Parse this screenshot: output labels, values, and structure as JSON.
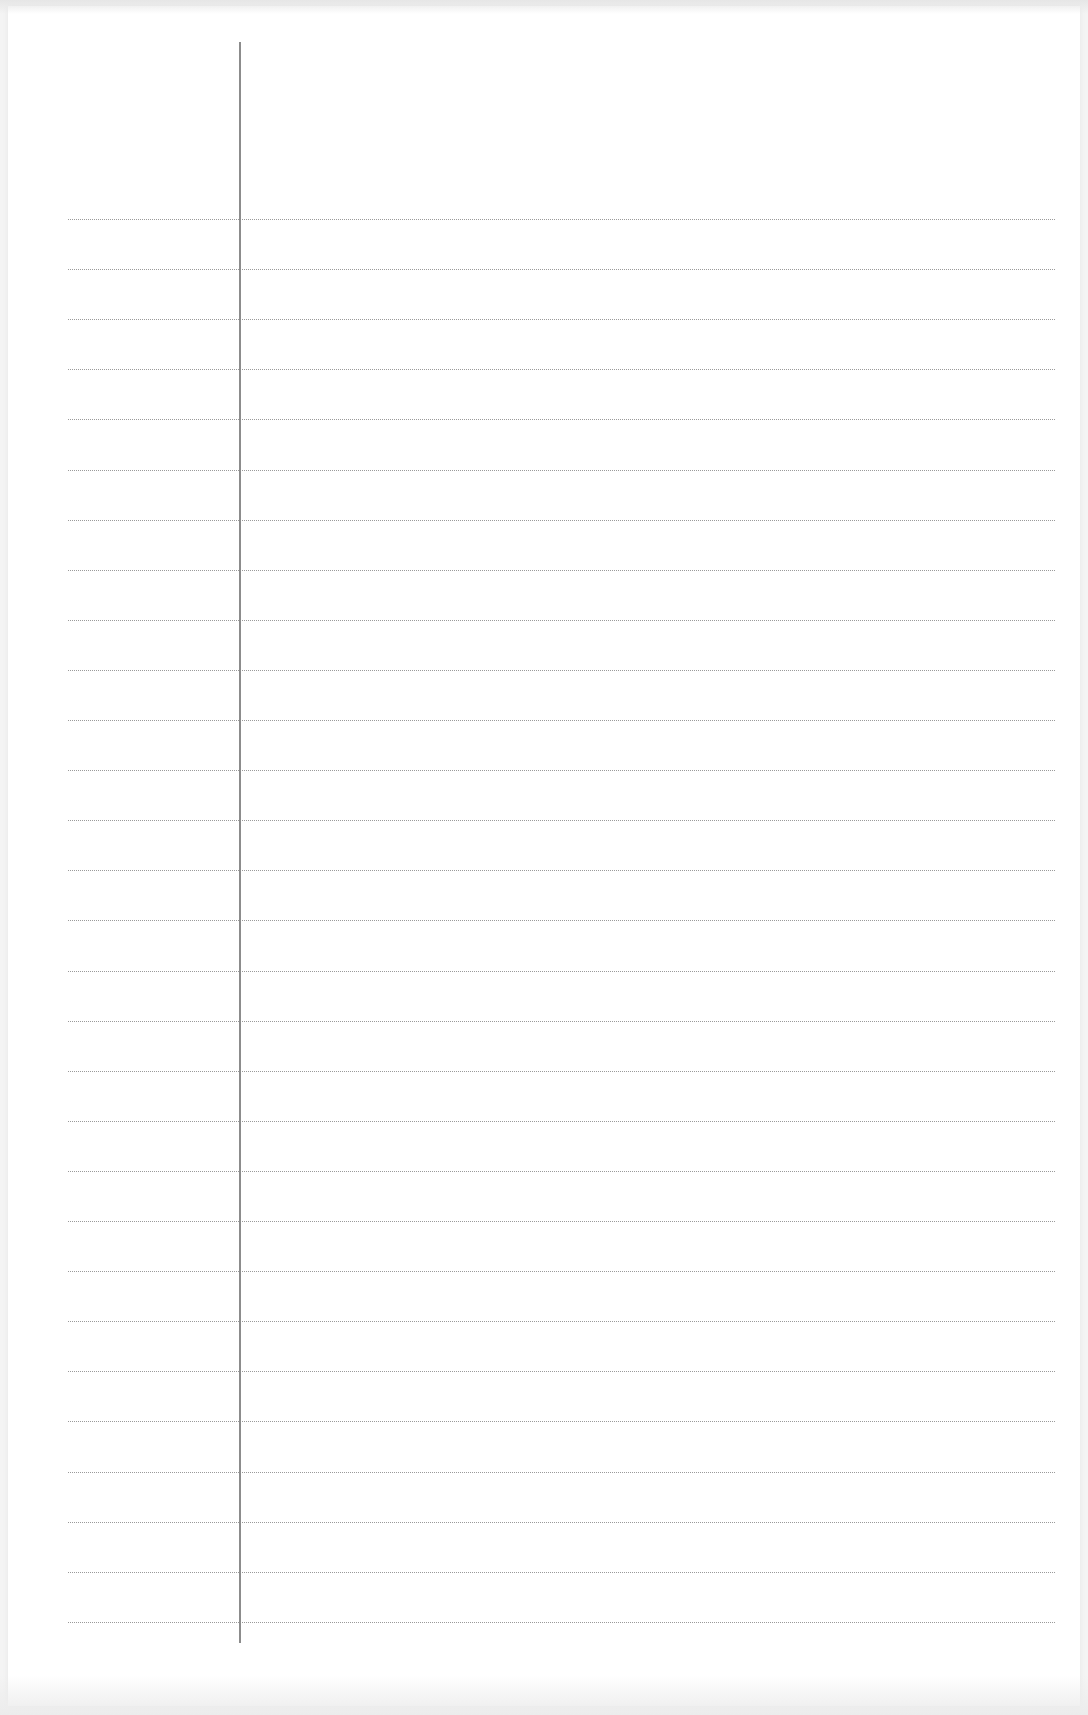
{
  "document": {
    "type": "lined notebook page",
    "content": "",
    "colors": {
      "paper": "#ffffff",
      "background": "#f4f4f4",
      "rule_line": "#9a9a9a",
      "margin_line": "#8c8c8c"
    },
    "margin": {
      "x": 240,
      "top": 42,
      "bottom": 1643
    },
    "rules": {
      "count": 29,
      "first_y": 219,
      "spacing": 50.1,
      "left": 68,
      "right": 1055
    }
  }
}
